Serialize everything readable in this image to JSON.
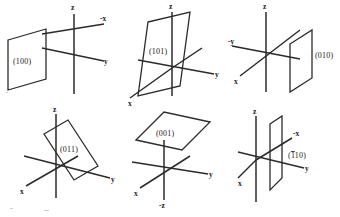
{
  "figure": {
    "background_color": "#ffffff",
    "line_color": "#2b2b2b",
    "text_color": "#1a1a1a"
  },
  "diagrams": [
    {
      "id": "diagram-100",
      "plane_label": "(100)",
      "plane_orientation": "vertical parallelogram at left of origin, normal along x",
      "axes": [
        {
          "name": "z",
          "label": "z",
          "direction": "up"
        },
        {
          "name": "-x",
          "label": "-x",
          "direction": "upper-right"
        },
        {
          "name": "y",
          "label": "y",
          "direction": "lower-right"
        }
      ]
    },
    {
      "id": "diagram-101",
      "plane_label": "(101)",
      "plane_orientation": "tilted parallelogram intercepting x and z",
      "axes": [
        {
          "name": "z",
          "label": "z",
          "direction": "up"
        },
        {
          "name": "x",
          "label": "x",
          "direction": "lower-left"
        },
        {
          "name": "y",
          "label": "y",
          "direction": "right"
        }
      ]
    },
    {
      "id": "diagram-010",
      "plane_label": "(010)",
      "plane_orientation": "vertical parallelogram at right of origin, normal along y",
      "axes": [
        {
          "name": "z",
          "label": "z",
          "direction": "up"
        },
        {
          "name": "-y",
          "label": "-y",
          "direction": "left"
        },
        {
          "name": "x",
          "label": "x",
          "direction": "lower-left"
        }
      ]
    },
    {
      "id": "diagram-011",
      "plane_label": "(011)",
      "plane_orientation": "tilted parallelogram intercepting y and z",
      "axes": [
        {
          "name": "z",
          "label": "z",
          "direction": "up"
        },
        {
          "name": "x",
          "label": "x",
          "direction": "lower-left"
        },
        {
          "name": "y",
          "label": "y",
          "direction": "lower-right"
        }
      ]
    },
    {
      "id": "diagram-001",
      "plane_label": "(001)",
      "plane_orientation": "horizontal rhombus above origin, normal along z",
      "axes": [
        {
          "name": "x",
          "label": "x",
          "direction": "lower-left"
        },
        {
          "name": "y",
          "label": "y",
          "direction": "right"
        },
        {
          "name": "-z",
          "label": "-z",
          "direction": "down"
        }
      ]
    },
    {
      "id": "diagram-1bar10",
      "plane_label_prefix": "(",
      "plane_label_bar": "1",
      "plane_label_rest": "10)",
      "plane_label": "(1̄10)",
      "plane_orientation": "vertical plane cutting x and y, normal along [1-10]",
      "axes": [
        {
          "name": "z",
          "label": "z",
          "direction": "up"
        },
        {
          "name": "-x",
          "label": "-x",
          "direction": "upper-right"
        },
        {
          "name": "x",
          "label": "x",
          "direction": "lower-left"
        },
        {
          "name": "y",
          "label": "y",
          "direction": "lower-right"
        }
      ]
    }
  ]
}
